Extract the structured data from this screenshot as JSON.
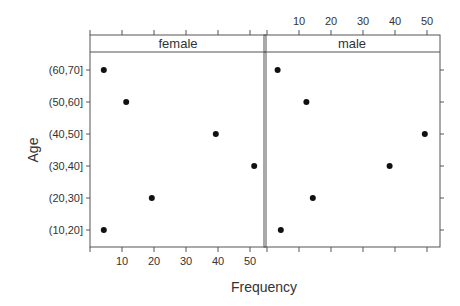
{
  "chart_data": {
    "type": "scatter",
    "subtype": "dotplot-trellis",
    "title": "",
    "xlabel": "Frequency",
    "ylabel": "Age",
    "xlim": [
      0,
      54
    ],
    "x_ticks": [
      10,
      20,
      30,
      40,
      50
    ],
    "grid": false,
    "categories": [
      "(10,20]",
      "(20,30]",
      "(30,40]",
      "(40,50]",
      "(50,60]",
      "(60,70]"
    ],
    "panels": [
      {
        "name": "female",
        "values": [
          4,
          19,
          51,
          39,
          11,
          4
        ],
        "x_axis_labels": "bottom"
      },
      {
        "name": "male",
        "values": [
          4,
          14,
          38,
          49,
          12,
          3
        ],
        "x_axis_labels": "top"
      }
    ],
    "colors": {
      "point": "#111111",
      "axis": "#555555",
      "strip_bg": "#ffffff"
    }
  },
  "labels": {
    "xlabel": "Frequency",
    "ylabel": "Age",
    "panel_female": "female",
    "panel_male": "male"
  }
}
